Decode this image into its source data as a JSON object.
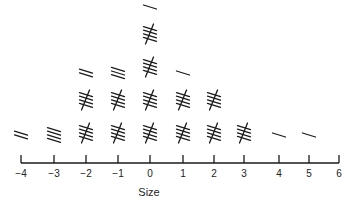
{
  "chart_data": {
    "type": "tally",
    "title": "",
    "xlabel": "Size",
    "ylabel": "",
    "categories": [
      "-4",
      "-3",
      "-2",
      "-1",
      "0",
      "1",
      "2",
      "3",
      "4",
      "5",
      "6"
    ],
    "x": [
      -4,
      -3,
      -2,
      -1,
      0,
      1,
      2,
      3,
      4,
      5,
      6
    ],
    "values": [
      2,
      4,
      12,
      13,
      21,
      11,
      10,
      5,
      1,
      1,
      0
    ],
    "tick_labels": [
      "−4",
      "−3",
      "−2",
      "−1",
      "0",
      "1",
      "2",
      "3",
      "4",
      "5",
      "6"
    ],
    "xlim": [
      -4,
      6
    ],
    "grid": false,
    "legend": null,
    "tally_group_size": 5
  },
  "layout": {
    "tick_x": [
      21,
      54,
      86,
      118,
      150,
      183,
      214,
      244,
      279,
      309,
      339
    ],
    "axis_y": 163,
    "tick_top": 155,
    "label_y": 177,
    "xlabel_x": 149,
    "xlabel_y": 196,
    "row_bottom_center": 133,
    "row_spacing": 33
  }
}
